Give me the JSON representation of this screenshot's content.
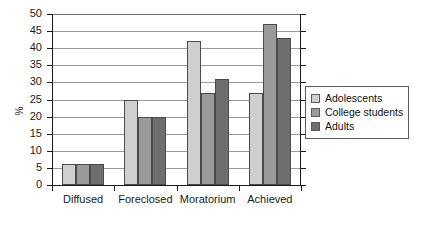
{
  "chart_data": {
    "type": "bar",
    "title": "",
    "subtitle": "",
    "xlabel": "",
    "ylabel": "%",
    "categories": [
      "Diffused",
      "Foreclosed",
      "Moratorium",
      "Achieved"
    ],
    "series": [
      {
        "name": "Adolescents",
        "values": [
          6,
          25,
          42,
          27
        ],
        "color": "#cfcfcf"
      },
      {
        "name": "College students",
        "values": [
          6,
          20,
          27,
          47
        ],
        "color": "#9a9a9a"
      },
      {
        "name": "Adults",
        "values": [
          6,
          20,
          31,
          43
        ],
        "color": "#6e6e6e"
      }
    ],
    "ylim": [
      0,
      50
    ],
    "ytick_step": 5,
    "yticks": [
      0,
      5,
      10,
      15,
      20,
      25,
      30,
      35,
      40,
      45,
      50
    ],
    "ytick_labels": [
      "0",
      "5",
      "10",
      "15",
      "20",
      "25",
      "30",
      "35",
      "40",
      "45",
      "50"
    ],
    "grid": true,
    "grid_axis": "y",
    "legend_position": "right",
    "bar_border_color": "#4a4a4a",
    "axis_color": "#1a1a1a",
    "grid_color": "#9a9a9a",
    "background": "#ffffff"
  },
  "legend": {
    "entries": [
      {
        "label": "Adolescents",
        "swatch": "#cfcfcf"
      },
      {
        "label": "College students",
        "swatch": "#9a9a9a"
      },
      {
        "label": "Adults",
        "swatch": "#6e6e6e"
      }
    ]
  }
}
